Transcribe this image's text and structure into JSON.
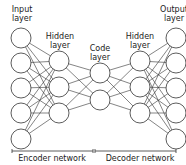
{
  "layers": [
    {
      "id": "input",
      "label": "Input\nlayer",
      "x": 21,
      "nodes": [
        38,
        63,
        88,
        113,
        139
      ]
    },
    {
      "id": "hidden-encoder",
      "label": "Hidden\nlayer",
      "x": 59,
      "nodes": [
        61,
        87,
        113
      ]
    },
    {
      "id": "code",
      "label": "Code\nlayer",
      "x": 100,
      "nodes": [
        73,
        100
      ]
    },
    {
      "id": "hidden-decoder",
      "label": "Hidden\nlayer",
      "x": 140,
      "nodes": [
        61,
        87,
        113
      ]
    },
    {
      "id": "output",
      "label": "Output\nlayer",
      "x": 176,
      "nodes": [
        38,
        63,
        88,
        113,
        139
      ]
    }
  ],
  "labels": {
    "input": "Input\nlayer",
    "hidden_encoder": "Hidden\nlayer",
    "code": "Code\nlayer",
    "hidden_decoder": "Hidden\nlayer",
    "output": "Output\nlayer"
  },
  "networks": {
    "encoder": "Encoder network",
    "decoder": "Decoder network"
  },
  "node_radius": 10,
  "colors": {
    "stroke": "#333333",
    "fill": "#ffffff",
    "text": "#222222"
  }
}
